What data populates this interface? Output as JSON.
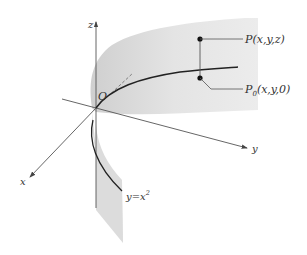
{
  "diagram": {
    "type": "3d-surface-sketch",
    "axes": {
      "x_label": "x",
      "y_label": "y",
      "z_label": "z",
      "origin_label": "O"
    },
    "curve_label": "y=x",
    "curve_exponent": "2",
    "points": {
      "P": "P(x,y,z)",
      "P0_main": "P",
      "P0_sub": "0",
      "P0_coords": "(x,y,0)"
    },
    "colors": {
      "surface": "#e2e2e2",
      "surface_dark": "#d0d0d0",
      "axis": "#555555",
      "curve": "#222222",
      "background": "#ffffff"
    }
  }
}
